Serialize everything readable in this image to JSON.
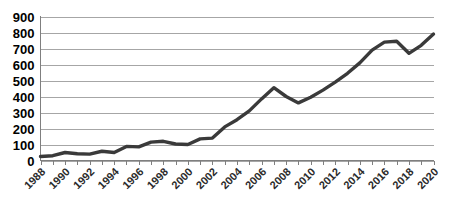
{
  "chart_data": {
    "type": "line",
    "title": "",
    "subtitle": "",
    "xlabel": "",
    "ylabel": "",
    "grid": "horizontal",
    "legend": "none",
    "accent_color": "#3a3a3a",
    "grid_color": "#a6a6a6",
    "axis_color": "#7f7f7f",
    "background_color": "#ffffff",
    "ylim": [
      0,
      900
    ],
    "ytick_step": 100,
    "ytick_labels": [
      "0",
      "100",
      "200",
      "300",
      "400",
      "500",
      "600",
      "700",
      "800",
      "900"
    ],
    "ytick_values": [
      0,
      100,
      200,
      300,
      400,
      500,
      600,
      700,
      800,
      900
    ],
    "xlim": [
      1988,
      2020
    ],
    "xtick_label_step": 2,
    "xtick_labels": [
      "1988",
      "1990",
      "1992",
      "1994",
      "1996",
      "1998",
      "2000",
      "2002",
      "2004",
      "2006",
      "2008",
      "2010",
      "2012",
      "2014",
      "2016",
      "2018",
      "2020"
    ],
    "x": [
      1988,
      1989,
      1990,
      1991,
      1992,
      1993,
      1994,
      1995,
      1996,
      1997,
      1998,
      1999,
      2000,
      2001,
      2002,
      2003,
      2004,
      2005,
      2006,
      2007,
      2008,
      2009,
      2010,
      2011,
      2012,
      2013,
      2014,
      2015,
      2016,
      2017,
      2018,
      2019,
      2020
    ],
    "values": [
      25,
      30,
      50,
      42,
      40,
      58,
      50,
      88,
      85,
      115,
      120,
      103,
      100,
      135,
      140,
      210,
      255,
      310,
      385,
      455,
      400,
      360,
      395,
      440,
      490,
      545,
      610,
      690,
      740,
      745,
      670,
      720,
      790
    ],
    "series": [
      {
        "name": "series-1",
        "color": "#3a3a3a",
        "values": [
          25,
          30,
          50,
          42,
          40,
          58,
          50,
          88,
          85,
          115,
          120,
          103,
          100,
          135,
          140,
          210,
          255,
          310,
          385,
          455,
          400,
          360,
          395,
          440,
          490,
          545,
          610,
          690,
          740,
          745,
          670,
          720,
          790
        ]
      }
    ]
  }
}
